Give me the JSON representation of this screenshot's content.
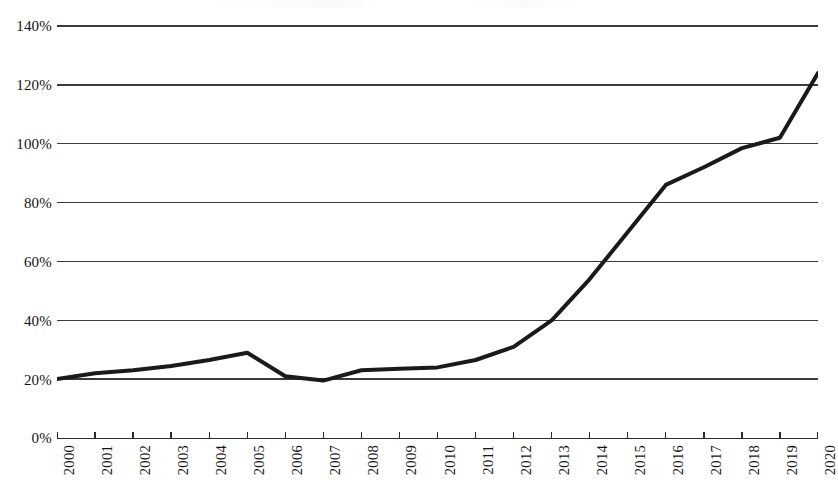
{
  "chart_data": {
    "type": "line",
    "title": "",
    "subtitle": "",
    "xlabel": "",
    "ylabel": "",
    "categories": [
      "2000",
      "2001",
      "2002",
      "2003",
      "2004",
      "2005",
      "2006",
      "2007",
      "2008",
      "2009",
      "2010",
      "2011",
      "2012",
      "2013",
      "2014",
      "2015",
      "2016",
      "2017",
      "2018",
      "2019",
      "2020"
    ],
    "x": [
      2000,
      2001,
      2002,
      2003,
      2004,
      2005,
      2006,
      2007,
      2008,
      2009,
      2010,
      2011,
      2012,
      2013,
      2014,
      2015,
      2016,
      2017,
      2018,
      2019,
      2020
    ],
    "values": [
      20,
      22,
      23,
      24.5,
      26.5,
      29,
      21,
      19.5,
      23,
      23.5,
      24,
      26.5,
      31,
      40,
      54,
      70,
      86,
      92,
      98.5,
      102,
      124
    ],
    "series": [
      {
        "name": "",
        "values": [
          20,
          22,
          23,
          24.5,
          26.5,
          29,
          21,
          19.5,
          23,
          23.5,
          24,
          26.5,
          31,
          40,
          54,
          70,
          86,
          92,
          98.5,
          102,
          124
        ],
        "color": "#1a1a1a"
      }
    ],
    "ylim": [
      0,
      140
    ],
    "xlim": [
      2000,
      2020
    ],
    "y_ticks": [
      0,
      20,
      40,
      60,
      80,
      100,
      120,
      140
    ],
    "y_tick_labels": [
      "0%",
      "20%",
      "40%",
      "60%",
      "80%",
      "100%",
      "120%",
      "140%"
    ],
    "x_tick_labels": [
      "2000",
      "2001",
      "2002",
      "2003",
      "2004",
      "2005",
      "2006",
      "2007",
      "2008",
      "2009",
      "2010",
      "2011",
      "2012",
      "2013",
      "2014",
      "2015",
      "2016",
      "2017",
      "2018",
      "2019",
      "2020"
    ],
    "x_tick_label_rotation": 90,
    "grid": "horizontal",
    "grid_color": "#3a3a3a",
    "legend": null,
    "legend_position": "none",
    "axis_color": "#2b2b2b",
    "line_width_px": 4,
    "background_color": "#ffffff",
    "annotations": []
  },
  "figure": {
    "name": "line-chart"
  }
}
